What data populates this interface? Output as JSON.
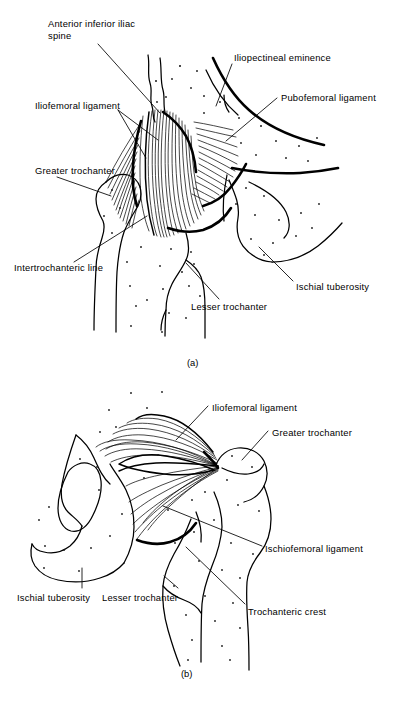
{
  "figure": {
    "background_color": "#ffffff",
    "ink_color": "#000000",
    "width": 396,
    "height": 709
  },
  "panels": [
    {
      "id": "a",
      "caption": "(a)",
      "view": "anterior",
      "labels": [
        {
          "key": "anterior-inferior-iliac-spine",
          "text": "Anterior inferior iliac\nspine",
          "x": 48,
          "y": 18
        },
        {
          "key": "iliopectineal-eminence",
          "text": "Iliopectineal eminence",
          "x": 234,
          "y": 52
        },
        {
          "key": "iliofemoral-ligament",
          "text": "Iliofemoral ligament",
          "x": 35,
          "y": 100
        },
        {
          "key": "pubofemoral-ligament",
          "text": "Pubofemoral ligament",
          "x": 281,
          "y": 92
        },
        {
          "key": "greater-trochanter",
          "text": "Greater trochanter",
          "x": 35,
          "y": 165
        },
        {
          "key": "intertrochanteric-line",
          "text": "Intertrochanteric line",
          "x": 14,
          "y": 262
        },
        {
          "key": "ischial-tuberosity",
          "text": "Ischial tuberosity",
          "x": 296,
          "y": 281
        },
        {
          "key": "lesser-trochanter",
          "text": "Lesser trochanter",
          "x": 191,
          "y": 301
        }
      ]
    },
    {
      "id": "b",
      "caption": "(b)",
      "view": "posterior",
      "labels": [
        {
          "key": "iliofemoral-ligament",
          "text": "Iliofemoral ligament",
          "x": 212,
          "y": 402
        },
        {
          "key": "greater-trochanter",
          "text": "Greater trochanter",
          "x": 272,
          "y": 427
        },
        {
          "key": "ischiofemoral-ligament",
          "text": "Ischiofemoral ligament",
          "x": 265,
          "y": 543
        },
        {
          "key": "ischial-tuberosity",
          "text": "Ischial tuberosity",
          "x": 17,
          "y": 592
        },
        {
          "key": "lesser-trochanter",
          "text": "Lesser trochanter",
          "x": 102,
          "y": 592
        },
        {
          "key": "trochanteric-crest",
          "text": "Trochanteric crest",
          "x": 248,
          "y": 606
        }
      ]
    }
  ],
  "captions": {
    "panel_a": "(a)",
    "panel_b": "(b)"
  }
}
